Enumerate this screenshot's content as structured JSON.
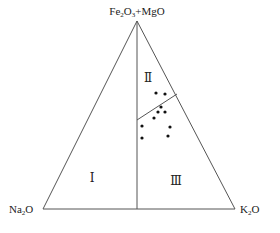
{
  "diagram": {
    "type": "ternary",
    "apex_label": {
      "main": "Fe",
      "sub1": "2",
      "mid": "O",
      "sub2": "3",
      "tail": "+MgO"
    },
    "left_label": {
      "main": "Na",
      "sub": "2",
      "tail": "O"
    },
    "right_label": {
      "main": "K",
      "sub": "2",
      "tail": "O"
    },
    "regions": [
      {
        "id": "I",
        "label": "Ⅰ"
      },
      {
        "id": "II",
        "label": "Ⅱ"
      },
      {
        "id": "III",
        "label": "Ⅲ"
      }
    ],
    "geometry": {
      "apex": [
        137,
        21
      ],
      "left": [
        43,
        209
      ],
      "right": [
        235,
        209
      ],
      "divider_bottom": [
        137,
        209
      ],
      "boundary_II_III": [
        [
          137,
          120
        ],
        [
          177,
          94
        ]
      ]
    },
    "points": [
      [
        156,
        93
      ],
      [
        165,
        94
      ],
      [
        161,
        107
      ],
      [
        158,
        112
      ],
      [
        165,
        112
      ],
      [
        154,
        118
      ],
      [
        142,
        126
      ],
      [
        170,
        127
      ],
      [
        142,
        138
      ],
      [
        168,
        136
      ]
    ],
    "colors": {
      "line": "#555555",
      "point": "#111111",
      "text": "#222222"
    }
  }
}
